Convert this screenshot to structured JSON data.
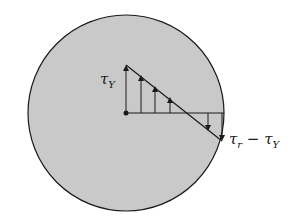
{
  "diagram": {
    "colors": {
      "fill": "#c9c9c9",
      "stroke": "#1a1a1a",
      "background": "#ffffff"
    },
    "labels": {
      "top": {
        "symbol": "τ",
        "sub": "Y"
      },
      "edge": {
        "symbol": "τ",
        "sub": "r",
        "minus": " − ",
        "symbol2": "τ",
        "sub2": "Y"
      }
    }
  }
}
